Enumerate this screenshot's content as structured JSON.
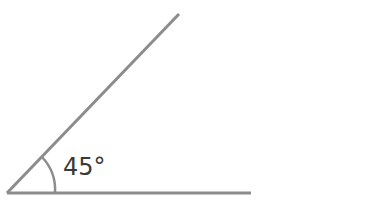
{
  "diagram": {
    "type": "angle",
    "angle_label": "45°",
    "angle_degrees": 45,
    "vertex": [
      7,
      193
    ],
    "ray_end_diagonal": [
      179,
      14
    ],
    "ray_end_horizontal": [
      251,
      193
    ],
    "line_color": "#8c8c8c",
    "text_color": "#3a3a3a"
  }
}
